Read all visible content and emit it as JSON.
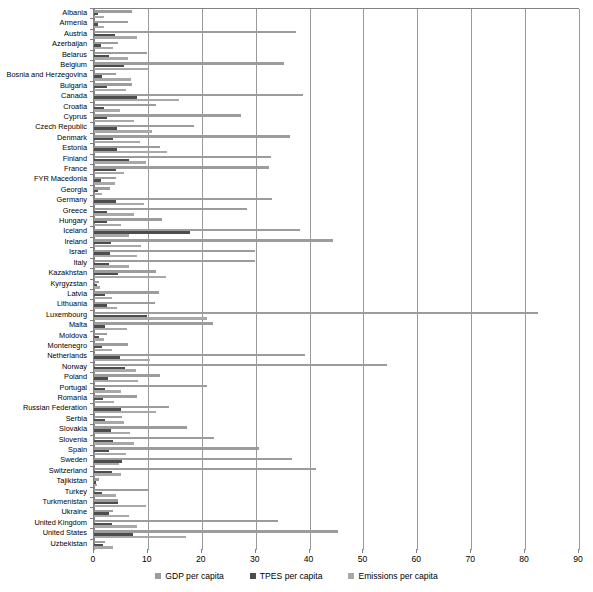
{
  "chart_data": {
    "type": "bar",
    "orientation": "horizontal",
    "title": "",
    "xlabel": "",
    "ylabel": "",
    "xlim": [
      0,
      90
    ],
    "xticks": [
      0,
      10,
      20,
      30,
      40,
      50,
      60,
      70,
      80,
      90
    ],
    "grid": true,
    "legend_position": "bottom",
    "colors": {
      "gdp": "#9c9c9c",
      "tpes": "#4d4d4d",
      "emissions": "#a8a8a8",
      "axis": "#808080",
      "gridline": "#9a9a9a"
    },
    "categories": [
      "Albania",
      "Armenia",
      "Austria",
      "Azerbaijan",
      "Belarus",
      "Belgium",
      "Bosnia and Herzegovina",
      "Bulgaria",
      "Canada",
      "Croatia",
      "Cyprus",
      "Czech Republic",
      "Denmark",
      "Estonia",
      "Finland",
      "France",
      "FYR Macedonia",
      "Georgia",
      "Germany",
      "Greece",
      "Hungary",
      "Iceland",
      "Ireland",
      "Israel",
      "Italy",
      "Kazakhstan",
      "Kyrgyzstan",
      "Latvia",
      "Lithuania",
      "Luxembourg",
      "Malta",
      "Moldova",
      "Montenegro",
      "Netherlands",
      "Norway",
      "Poland",
      "Portugal",
      "Romania",
      "Russian Federation",
      "Serbia",
      "Slovakia",
      "Slovenia",
      "Spain",
      "Sweden",
      "Switzerland",
      "Tajikistan",
      "Turkey",
      "Turkmenistan",
      "Ukraine",
      "United Kingdom",
      "United States",
      "Uzbekistan"
    ],
    "series": [
      {
        "name": "GDP per capita",
        "key": "gdp",
        "values": [
          7.0,
          6.4,
          37.5,
          4.4,
          9.9,
          35.2,
          4.1,
          7.1,
          38.8,
          11.5,
          27.3,
          18.6,
          36.3,
          12.2,
          32.8,
          32.5,
          4.0,
          3.0,
          33.0,
          28.4,
          12.7,
          38.2,
          44.4,
          29.8,
          29.8,
          11.5,
          1.0,
          12.0,
          11.3,
          82.3,
          22.1,
          2.5,
          6.4,
          39.2,
          54.3,
          12.2,
          21.0,
          8.0,
          14.0,
          5.2,
          17.2,
          22.2,
          30.6,
          36.8,
          41.2,
          1.0,
          10.0,
          4.5,
          3.5,
          34.2,
          45.3,
          2.0
        ]
      },
      {
        "name": "TPES per capita",
        "key": "tpes",
        "values": [
          0.7,
          0.8,
          3.9,
          1.3,
          2.8,
          5.5,
          1.5,
          2.5,
          7.9,
          1.9,
          2.4,
          4.2,
          3.5,
          4.2,
          6.5,
          4.0,
          1.3,
          0.8,
          4.0,
          2.4,
          2.5,
          17.9,
          3.2,
          3.0,
          2.8,
          4.5,
          0.5,
          2.1,
          2.5,
          9.9,
          2.0,
          0.9,
          1.5,
          4.8,
          5.8,
          2.6,
          2.1,
          1.7,
          5.0,
          2.1,
          3.2,
          3.5,
          2.7,
          5.2,
          3.4,
          0.4,
          1.5,
          4.5,
          2.7,
          3.3,
          7.2,
          1.7
        ]
      },
      {
        "name": "Emissions per capita",
        "key": "emis",
        "values": [
          1.8,
          1.8,
          8.0,
          3.5,
          6.4,
          10.0,
          6.8,
          6.0,
          15.7,
          4.9,
          7.5,
          10.8,
          8.5,
          13.6,
          9.6,
          5.6,
          3.9,
          1.4,
          9.3,
          7.4,
          5.1,
          6.5,
          8.7,
          8.0,
          6.5,
          13.4,
          1.2,
          3.4,
          4.3,
          20.9,
          6.1,
          1.8,
          3.3,
          10.4,
          7.8,
          8.1,
          5.1,
          3.8,
          11.5,
          5.6,
          6.7,
          7.5,
          5.9,
          4.7,
          5.0,
          0.6,
          4.0,
          9.6,
          6.5,
          7.9,
          17.0,
          3.6
        ]
      }
    ]
  }
}
